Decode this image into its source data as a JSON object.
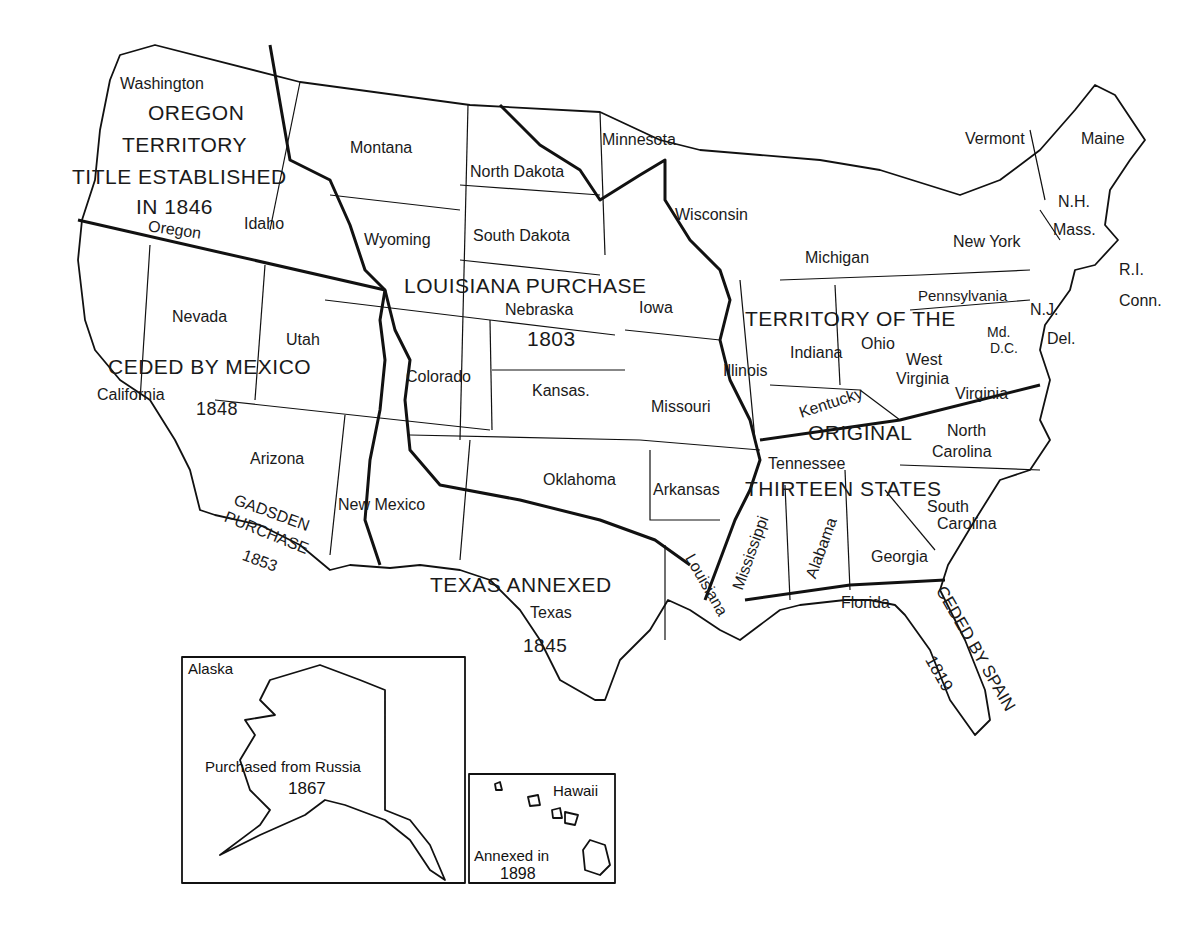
{
  "map": {
    "title": "United States territorial acquisitions",
    "colors": {
      "background": "#ffffff",
      "line": "#111111"
    },
    "regions": [
      {
        "name": "OREGON",
        "id": "oregon_l1"
      },
      {
        "name": "TERRITORY",
        "id": "oregon_l2"
      },
      {
        "name": "TITLE ESTABLISHED",
        "id": "oregon_l3"
      },
      {
        "name": "IN 1846",
        "id": "oregon_l4"
      },
      {
        "name": "LOUISIANA PURCHASE",
        "id": "louisiana"
      },
      {
        "name": "1803",
        "id": "louisiana_year"
      },
      {
        "name": "CEDED BY MEXICO",
        "id": "mexico"
      },
      {
        "name": "1848",
        "id": "mexico_year"
      },
      {
        "name": "GADSDEN",
        "id": "gadsden_l1"
      },
      {
        "name": "PURCHASE",
        "id": "gadsden_l2"
      },
      {
        "name": "1853",
        "id": "gadsden_year"
      },
      {
        "name": "TEXAS ANNEXED",
        "id": "texas"
      },
      {
        "name": "1845",
        "id": "texas_year"
      },
      {
        "name": "TERRITORY OF THE",
        "id": "orig_l1"
      },
      {
        "name": "ORIGINAL",
        "id": "orig_l2"
      },
      {
        "name": "THIRTEEN STATES",
        "id": "orig_l3"
      },
      {
        "name": "CEDED BY SPAIN",
        "id": "spain"
      },
      {
        "name": "1819",
        "id": "spain_year"
      }
    ],
    "states": {
      "washington": "Washington",
      "oregon": "Oregon",
      "idaho": "Idaho",
      "montana": "Montana",
      "wyoming": "Wyoming",
      "north_dakota": "North Dakota",
      "south_dakota": "South Dakota",
      "minnesota": "Minnesota",
      "wisconsin": "Wisconsin",
      "michigan": "Michigan",
      "nevada": "Nevada",
      "utah": "Utah",
      "colorado": "Colorado",
      "nebraska": "Nebraska",
      "iowa": "Iowa",
      "kansas": "Kansas.",
      "missouri": "Missouri",
      "illinois": "Illinois",
      "indiana": "Indiana",
      "ohio": "Ohio",
      "california": "California",
      "arizona": "Arizona",
      "new_mexico": "New Mexico",
      "oklahoma": "Oklahoma",
      "arkansas": "Arkansas",
      "texas": "Texas",
      "louisiana": "Louisiana",
      "mississippi": "Mississippi",
      "alabama": "Alabama",
      "georgia": "Georgia",
      "florida": "Florida",
      "tennessee": "Tennessee",
      "kentucky": "Kentucky",
      "west": "West",
      "virginia_w": "Virginia",
      "virginia": "Virginia",
      "north": "North",
      "carolina_n": "Carolina",
      "south": "South",
      "carolina_s": "Carolina",
      "pennsylvania": "Pennsylvania",
      "new_york": "New York",
      "vermont": "Vermont",
      "maine": "Maine",
      "nh": "N.H.",
      "mass": "Mass.",
      "ri": "R.I.",
      "conn": "Conn.",
      "nj": "N.J.",
      "del": "Del.",
      "md": "Md.",
      "dc": "D.C."
    },
    "insets": {
      "alaska": {
        "title": "Alaska",
        "note": "Purchased from Russia",
        "year": "1867"
      },
      "hawaii": {
        "title": "Hawaii",
        "note": "Annexed in",
        "year": "1898"
      }
    }
  }
}
